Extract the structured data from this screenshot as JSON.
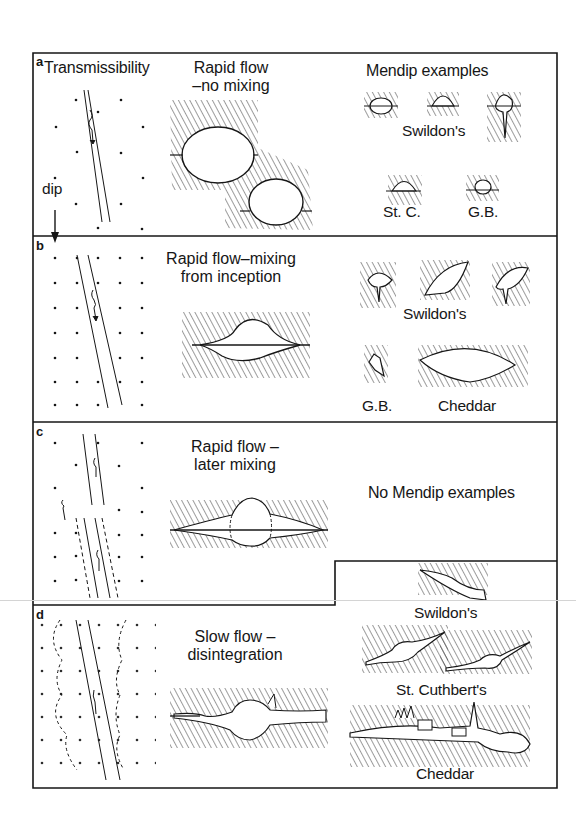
{
  "figure": {
    "panels": [
      {
        "id": "a",
        "letter": "a",
        "left_label": "Transmissibility",
        "dip_label": "dip",
        "title_line1": "Rapid flow",
        "title_line2": "–no mixing",
        "examples_heading": "Mendip examples",
        "examples": [
          {
            "label": "Swildon's"
          },
          {
            "label": "St. C."
          },
          {
            "label": "G.B."
          }
        ]
      },
      {
        "id": "b",
        "letter": "b",
        "title_line1": "Rapid flow–mixing",
        "title_line2": "from inception",
        "examples": [
          {
            "label": "Swildon's"
          },
          {
            "label": "G.B."
          },
          {
            "label": "Cheddar"
          }
        ]
      },
      {
        "id": "c",
        "letter": "c",
        "title_line1": "Rapid flow –",
        "title_line2": "later mixing",
        "no_examples_text": "No Mendip examples"
      },
      {
        "id": "d",
        "letter": "d",
        "title_line1": "Slow flow –",
        "title_line2": "disintegration",
        "examples": [
          {
            "label": "Swildon's"
          },
          {
            "label": "St. Cuthbert's"
          },
          {
            "label": "Cheddar"
          }
        ]
      }
    ],
    "colors": {
      "ink": "#161616",
      "background": "#ffffff",
      "hatch": "#3a3a3a"
    }
  }
}
